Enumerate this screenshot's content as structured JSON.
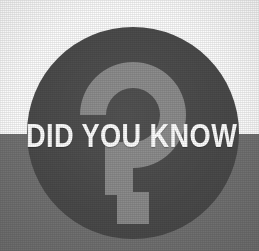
{
  "graphic": {
    "kind": "did-you-know-badge",
    "headline": "DID YOU KNOW",
    "symbol_icon": "question-mark-icon",
    "width": 259,
    "height": 251
  },
  "background": {
    "top_color": "#fdfdfd",
    "bottom_color": "#737373",
    "split_y": 134
  },
  "badge": {
    "circle_color": "#4a4a4a",
    "circle_diameter": 212,
    "circle_center_x": 133,
    "circle_center_y": 133,
    "question_mark_color": "#8a8a8a",
    "headline_color": "#ffffff"
  }
}
